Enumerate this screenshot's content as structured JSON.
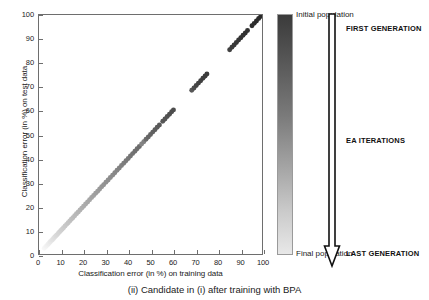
{
  "caption": "(ii) Candidate in (i) after training with BPA",
  "colorbar": {
    "top_label": "Initial population",
    "bottom_label": "Final population",
    "top_color": "#3b3b3b",
    "bottom_color": "#e8e8e8"
  },
  "annotations": {
    "first_generation": "FIRST GENERATION",
    "ea_iterations": "EA ITERATIONS",
    "last_generation": "LAST GENERATION"
  },
  "chart_data": {
    "type": "scatter",
    "title": "",
    "xlabel": "Classification error (in %) on training data",
    "ylabel": "Classification error (in %) on test data",
    "xlim": [
      0,
      100
    ],
    "ylim": [
      0,
      100
    ],
    "xticks": [
      0,
      10,
      20,
      30,
      40,
      50,
      60,
      70,
      80,
      90,
      100
    ],
    "yticks": [
      0,
      10,
      20,
      30,
      40,
      50,
      60,
      70,
      80,
      90,
      100
    ],
    "grid": false,
    "legend": "colorbar",
    "legend_position": "right",
    "colormap": "gray-reversed",
    "colormap_meaning": "dark = initial population (first generation), light = final population (last generation)",
    "marker": "circle",
    "marker_size": 5,
    "series": [
      {
        "name": "EA population candidates",
        "description": "Training error vs test error, points lie on the identity line y = x; shade encodes generation",
        "points": [
          {
            "x": 2.4,
            "y": 2.4,
            "shade": 0.97
          },
          {
            "x": 2.9,
            "y": 2.9,
            "shade": 0.96
          },
          {
            "x": 3.3,
            "y": 3.3,
            "shade": 0.95
          },
          {
            "x": 3.8,
            "y": 3.8,
            "shade": 0.94
          },
          {
            "x": 4.2,
            "y": 4.2,
            "shade": 0.93
          },
          {
            "x": 4.7,
            "y": 4.7,
            "shade": 0.92
          },
          {
            "x": 5.1,
            "y": 5.1,
            "shade": 0.91
          },
          {
            "x": 5.6,
            "y": 5.6,
            "shade": 0.9
          },
          {
            "x": 6.0,
            "y": 6.0,
            "shade": 0.89
          },
          {
            "x": 6.5,
            "y": 6.5,
            "shade": 0.88
          },
          {
            "x": 7.0,
            "y": 7.0,
            "shade": 0.87
          },
          {
            "x": 7.5,
            "y": 7.5,
            "shade": 0.86
          },
          {
            "x": 8.0,
            "y": 8.0,
            "shade": 0.85
          },
          {
            "x": 8.6,
            "y": 8.6,
            "shade": 0.84
          },
          {
            "x": 9.2,
            "y": 9.2,
            "shade": 0.83
          },
          {
            "x": 9.8,
            "y": 9.8,
            "shade": 0.82
          },
          {
            "x": 10.4,
            "y": 10.4,
            "shade": 0.81
          },
          {
            "x": 11.0,
            "y": 11.0,
            "shade": 0.8
          },
          {
            "x": 11.7,
            "y": 11.7,
            "shade": 0.79
          },
          {
            "x": 12.4,
            "y": 12.4,
            "shade": 0.78
          },
          {
            "x": 13.1,
            "y": 13.1,
            "shade": 0.77
          },
          {
            "x": 13.8,
            "y": 13.8,
            "shade": 0.76
          },
          {
            "x": 14.5,
            "y": 14.5,
            "shade": 0.75
          },
          {
            "x": 15.2,
            "y": 15.2,
            "shade": 0.74
          },
          {
            "x": 16.0,
            "y": 16.0,
            "shade": 0.73
          },
          {
            "x": 16.8,
            "y": 16.8,
            "shade": 0.72
          },
          {
            "x": 17.6,
            "y": 17.6,
            "shade": 0.71
          },
          {
            "x": 18.4,
            "y": 18.4,
            "shade": 0.7
          },
          {
            "x": 19.2,
            "y": 19.2,
            "shade": 0.69
          },
          {
            "x": 20.0,
            "y": 20.0,
            "shade": 0.68
          },
          {
            "x": 20.9,
            "y": 20.9,
            "shade": 0.67
          },
          {
            "x": 21.8,
            "y": 21.8,
            "shade": 0.66
          },
          {
            "x": 22.7,
            "y": 22.7,
            "shade": 0.65
          },
          {
            "x": 23.6,
            "y": 23.6,
            "shade": 0.64
          },
          {
            "x": 24.5,
            "y": 24.5,
            "shade": 0.63
          },
          {
            "x": 25.4,
            "y": 25.4,
            "shade": 0.62
          },
          {
            "x": 26.3,
            "y": 26.3,
            "shade": 0.61
          },
          {
            "x": 27.2,
            "y": 27.2,
            "shade": 0.6
          },
          {
            "x": 28.1,
            "y": 28.1,
            "shade": 0.59
          },
          {
            "x": 29.0,
            "y": 29.0,
            "shade": 0.58
          },
          {
            "x": 30.0,
            "y": 30.0,
            "shade": 0.57
          },
          {
            "x": 31.0,
            "y": 31.0,
            "shade": 0.56
          },
          {
            "x": 32.0,
            "y": 32.0,
            "shade": 0.55
          },
          {
            "x": 33.0,
            "y": 33.0,
            "shade": 0.54
          },
          {
            "x": 34.0,
            "y": 34.0,
            "shade": 0.53
          },
          {
            "x": 35.0,
            "y": 35.0,
            "shade": 0.52
          },
          {
            "x": 36.0,
            "y": 36.0,
            "shade": 0.51
          },
          {
            "x": 37.0,
            "y": 37.0,
            "shade": 0.5
          },
          {
            "x": 38.0,
            "y": 38.0,
            "shade": 0.49
          },
          {
            "x": 39.0,
            "y": 39.0,
            "shade": 0.48
          },
          {
            "x": 40.0,
            "y": 40.0,
            "shade": 0.47
          },
          {
            "x": 41.0,
            "y": 41.0,
            "shade": 0.46
          },
          {
            "x": 42.0,
            "y": 42.0,
            "shade": 0.45
          },
          {
            "x": 43.0,
            "y": 43.0,
            "shade": 0.44
          },
          {
            "x": 44.0,
            "y": 44.0,
            "shade": 0.43
          },
          {
            "x": 45.0,
            "y": 45.0,
            "shade": 0.42
          },
          {
            "x": 46.0,
            "y": 46.0,
            "shade": 0.52
          },
          {
            "x": 47.0,
            "y": 47.0,
            "shade": 0.5
          },
          {
            "x": 48.0,
            "y": 48.0,
            "shade": 0.42
          },
          {
            "x": 49.0,
            "y": 49.0,
            "shade": 0.4
          },
          {
            "x": 50.0,
            "y": 50.0,
            "shade": 0.39
          },
          {
            "x": 51.0,
            "y": 51.0,
            "shade": 0.38
          },
          {
            "x": 52.0,
            "y": 52.0,
            "shade": 0.37
          },
          {
            "x": 53.0,
            "y": 53.0,
            "shade": 0.36
          },
          {
            "x": 54.0,
            "y": 54.0,
            "shade": 0.35
          },
          {
            "x": 55.5,
            "y": 55.5,
            "shade": 0.34
          },
          {
            "x": 56.5,
            "y": 56.5,
            "shade": 0.33
          },
          {
            "x": 57.5,
            "y": 57.5,
            "shade": 0.32
          },
          {
            "x": 58.5,
            "y": 58.5,
            "shade": 0.31
          },
          {
            "x": 59.5,
            "y": 59.5,
            "shade": 0.3
          },
          {
            "x": 60.3,
            "y": 60.3,
            "shade": 0.3
          },
          {
            "x": 68.5,
            "y": 68.5,
            "shade": 0.34
          },
          {
            "x": 69.5,
            "y": 69.5,
            "shade": 0.3
          },
          {
            "x": 70.5,
            "y": 70.5,
            "shade": 0.27
          },
          {
            "x": 71.5,
            "y": 71.5,
            "shade": 0.26
          },
          {
            "x": 72.5,
            "y": 72.5,
            "shade": 0.25
          },
          {
            "x": 73.5,
            "y": 73.5,
            "shade": 0.24
          },
          {
            "x": 74.5,
            "y": 74.5,
            "shade": 0.23
          },
          {
            "x": 75.3,
            "y": 75.3,
            "shade": 0.23
          },
          {
            "x": 85.5,
            "y": 85.5,
            "shade": 0.25
          },
          {
            "x": 86.5,
            "y": 86.5,
            "shade": 0.23
          },
          {
            "x": 87.5,
            "y": 87.5,
            "shade": 0.22
          },
          {
            "x": 88.5,
            "y": 88.5,
            "shade": 0.21
          },
          {
            "x": 89.5,
            "y": 89.5,
            "shade": 0.21
          },
          {
            "x": 90.5,
            "y": 90.5,
            "shade": 0.2
          },
          {
            "x": 91.5,
            "y": 91.5,
            "shade": 0.2
          },
          {
            "x": 92.5,
            "y": 92.5,
            "shade": 0.19
          },
          {
            "x": 93.5,
            "y": 93.5,
            "shade": 0.19
          },
          {
            "x": 95.5,
            "y": 95.5,
            "shade": 0.18
          },
          {
            "x": 96.5,
            "y": 96.5,
            "shade": 0.18
          },
          {
            "x": 97.5,
            "y": 97.5,
            "shade": 0.17
          },
          {
            "x": 98.5,
            "y": 98.5,
            "shade": 0.17
          },
          {
            "x": 99.5,
            "y": 99.5,
            "shade": 0.16
          }
        ]
      }
    ]
  }
}
